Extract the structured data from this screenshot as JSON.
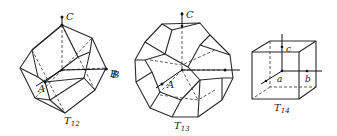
{
  "figures": [
    {
      "id": "T12",
      "caption_main": "T",
      "caption_sub": "12",
      "axes": {
        "c": "C",
        "b": "B",
        "a": "A"
      },
      "description": "rhombic dodecahedron (Brillouin zone)"
    },
    {
      "id": "T13",
      "caption_main": "T",
      "caption_sub": "13",
      "axes": {
        "c": "C",
        "b": "B",
        "a": "A"
      },
      "description": "truncated octahedron (Brillouin zone)"
    },
    {
      "id": "T14",
      "caption_main": "T",
      "caption_sub": "14",
      "axes": {
        "c": "c",
        "b": "b",
        "a": "a"
      },
      "description": "cube (Brillouin zone)"
    }
  ],
  "colors": {
    "line": "#2a2a2a",
    "background": "#ffffff"
  }
}
